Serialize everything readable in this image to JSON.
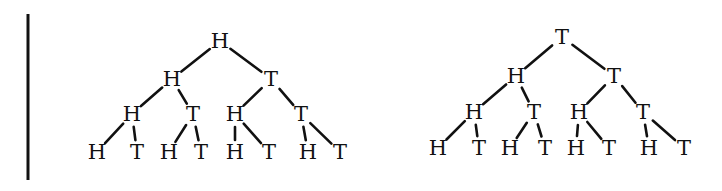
{
  "divider": {
    "x": 28,
    "y1": 14,
    "y2": 180
  },
  "trees": [
    {
      "name": "left-tree",
      "nodes": [
        {
          "id": "L0",
          "label": "H",
          "x": 220,
          "y": 41
        },
        {
          "id": "L1",
          "label": "H",
          "x": 172,
          "y": 79
        },
        {
          "id": "L2",
          "label": "T",
          "x": 271,
          "y": 79
        },
        {
          "id": "L3",
          "label": "H",
          "x": 132,
          "y": 114
        },
        {
          "id": "L4",
          "label": "T",
          "x": 193,
          "y": 114
        },
        {
          "id": "L5",
          "label": "H",
          "x": 235,
          "y": 114
        },
        {
          "id": "L6",
          "label": "T",
          "x": 301,
          "y": 114
        },
        {
          "id": "L7",
          "label": "H",
          "x": 97,
          "y": 152
        },
        {
          "id": "L8",
          "label": "T",
          "x": 137,
          "y": 152
        },
        {
          "id": "L9",
          "label": "H",
          "x": 169,
          "y": 152
        },
        {
          "id": "L10",
          "label": "T",
          "x": 201,
          "y": 152
        },
        {
          "id": "L11",
          "label": "H",
          "x": 235,
          "y": 152
        },
        {
          "id": "L12",
          "label": "T",
          "x": 269,
          "y": 152
        },
        {
          "id": "L13",
          "label": "H",
          "x": 308,
          "y": 152
        },
        {
          "id": "L14",
          "label": "T",
          "x": 340,
          "y": 152
        }
      ],
      "edges": [
        [
          "L0",
          "L1"
        ],
        [
          "L0",
          "L2"
        ],
        [
          "L1",
          "L3"
        ],
        [
          "L1",
          "L4"
        ],
        [
          "L2",
          "L5"
        ],
        [
          "L2",
          "L6"
        ],
        [
          "L3",
          "L7"
        ],
        [
          "L3",
          "L8"
        ],
        [
          "L4",
          "L9"
        ],
        [
          "L4",
          "L10"
        ],
        [
          "L5",
          "L11"
        ],
        [
          "L5",
          "L12"
        ],
        [
          "L6",
          "L13"
        ],
        [
          "L6",
          "L14"
        ]
      ]
    },
    {
      "name": "right-tree",
      "nodes": [
        {
          "id": "R0",
          "label": "T",
          "x": 562,
          "y": 37
        },
        {
          "id": "R1",
          "label": "H",
          "x": 516,
          "y": 76
        },
        {
          "id": "R2",
          "label": "T",
          "x": 614,
          "y": 76
        },
        {
          "id": "R3",
          "label": "H",
          "x": 474,
          "y": 112
        },
        {
          "id": "R4",
          "label": "T",
          "x": 534,
          "y": 112
        },
        {
          "id": "R5",
          "label": "H",
          "x": 579,
          "y": 112
        },
        {
          "id": "R6",
          "label": "T",
          "x": 643,
          "y": 112
        },
        {
          "id": "R7",
          "label": "H",
          "x": 438,
          "y": 148
        },
        {
          "id": "R8",
          "label": "T",
          "x": 479,
          "y": 148
        },
        {
          "id": "R9",
          "label": "H",
          "x": 510,
          "y": 148
        },
        {
          "id": "R10",
          "label": "T",
          "x": 545,
          "y": 148
        },
        {
          "id": "R11",
          "label": "H",
          "x": 576,
          "y": 148
        },
        {
          "id": "R12",
          "label": "T",
          "x": 609,
          "y": 148
        },
        {
          "id": "R13",
          "label": "H",
          "x": 649,
          "y": 148
        },
        {
          "id": "R14",
          "label": "T",
          "x": 684,
          "y": 148
        }
      ],
      "edges": [
        [
          "R0",
          "R1"
        ],
        [
          "R0",
          "R2"
        ],
        [
          "R1",
          "R3"
        ],
        [
          "R1",
          "R4"
        ],
        [
          "R2",
          "R5"
        ],
        [
          "R2",
          "R6"
        ],
        [
          "R3",
          "R7"
        ],
        [
          "R3",
          "R8"
        ],
        [
          "R4",
          "R9"
        ],
        [
          "R4",
          "R10"
        ],
        [
          "R5",
          "R11"
        ],
        [
          "R5",
          "R12"
        ],
        [
          "R6",
          "R13"
        ],
        [
          "R6",
          "R14"
        ]
      ]
    }
  ]
}
